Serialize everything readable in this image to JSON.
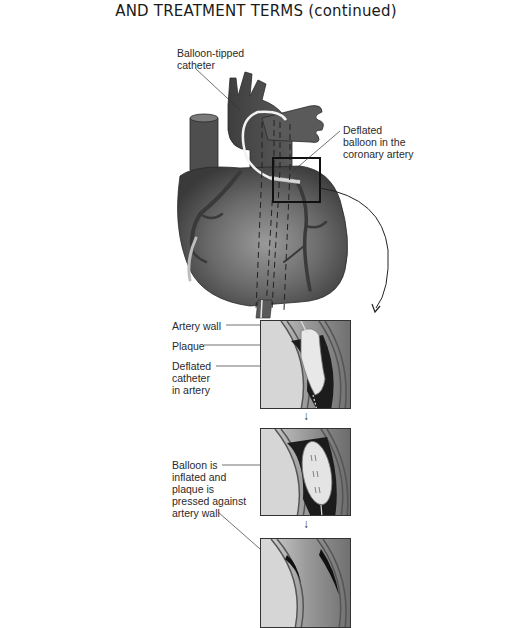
{
  "page": {
    "heading": "AND TREATMENT TERMS (continued)"
  },
  "figure": {
    "heart_labels": {
      "catheter": "Balloon-tipped\ncatheter",
      "deflated_balloon": "Deflated\nballoon in the\ncoronary artery"
    },
    "panels": [
      {
        "id": "panel-1",
        "labels": [
          {
            "text": "Artery wall"
          },
          {
            "text": "Plaque"
          },
          {
            "text": "Deflated\ncatheter\nin artery"
          }
        ]
      },
      {
        "id": "panel-2",
        "labels": [
          {
            "text": "Balloon is\ninflated and\nplaque is\npressed against\nartery wall"
          }
        ]
      },
      {
        "id": "panel-3",
        "labels": []
      }
    ],
    "arrows": {
      "down_1": "↓",
      "down_2": "↓"
    },
    "colors": {
      "heart_dark": "#3d3d3d",
      "heart_mid": "#6a6a6a",
      "heart_light": "#a8a8a8",
      "artery_lumen": "#1c1c1c",
      "plaque": "#e6e6e6",
      "panel_border": "#333333"
    }
  }
}
